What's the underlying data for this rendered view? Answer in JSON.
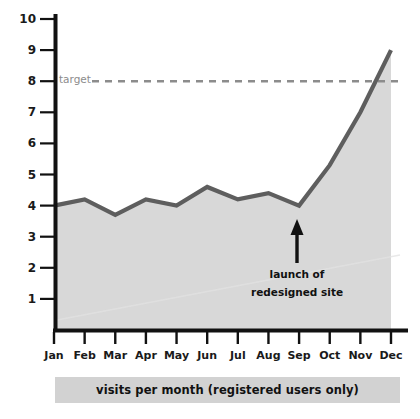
{
  "chart_data": {
    "type": "area",
    "title": "",
    "caption": "visits per month (registered users only)",
    "xlabel": "",
    "ylabel": "",
    "categories": [
      "Jan",
      "Feb",
      "Mar",
      "Apr",
      "May",
      "Jun",
      "Jul",
      "Aug",
      "Sep",
      "Oct",
      "Nov",
      "Dec"
    ],
    "series": [
      {
        "name": "visits per month (registered users only)",
        "values": [
          4.0,
          4.2,
          3.7,
          4.2,
          4.0,
          4.6,
          4.2,
          4.4,
          4.0,
          5.3,
          7.0,
          9.0
        ]
      }
    ],
    "ylim": [
      0,
      10
    ],
    "yticks": [
      "1",
      "2",
      "3",
      "4",
      "5",
      "6",
      "7",
      "8",
      "9",
      "10"
    ],
    "xticks": [
      "Jan",
      "Feb",
      "Mar",
      "Apr",
      "May",
      "Jun",
      "Jul",
      "Aug",
      "Sep",
      "Oct",
      "Nov",
      "Dec"
    ],
    "grid": false,
    "legend": "none",
    "reference_line": {
      "label": "target",
      "value": 8,
      "style": "dashed",
      "color": "#8c8c8c"
    },
    "annotations": [
      {
        "name": "launch-annotation",
        "line1": "launch of",
        "line2": "redesigned site",
        "points_at_category": "Sep",
        "arrow": "up"
      }
    ],
    "colors": {
      "line": "#5e5e5e",
      "area_fill": "#d8d8d8",
      "axis": "#111111",
      "target_line": "#8c8c8c",
      "caption_bar": "#d2d2d2",
      "text": "#1a1a1a",
      "background": "#ffffff"
    }
  }
}
